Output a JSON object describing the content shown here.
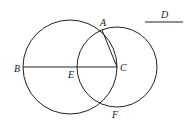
{
  "diagram": {
    "labels": {
      "A": "A",
      "B": "B",
      "C": "C",
      "D": "D",
      "E": "E",
      "F": "F"
    },
    "stroke_color": "#222222",
    "big_circle": {
      "cx": 70,
      "cy": 67,
      "r": 47
    },
    "small_circle": {
      "cx": 117,
      "cy": 67,
      "r": 40
    },
    "line_BC": {
      "x1": 23,
      "y1": 67,
      "x2": 117,
      "y2": 67
    },
    "line_AC": {
      "x1": 102,
      "y1": 30,
      "x2": 117,
      "y2": 67
    },
    "segment_D": {
      "x1": 145,
      "y1": 22,
      "x2": 183,
      "y2": 22
    }
  }
}
